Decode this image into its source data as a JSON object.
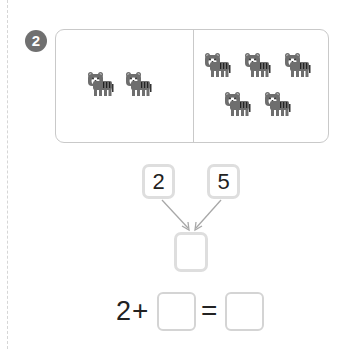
{
  "problem": {
    "number": "2",
    "left_group_count": 2,
    "right_group_count": 5,
    "icon": "tiger-icon"
  },
  "number_bond": {
    "left_part": "2",
    "right_part": "5",
    "whole": ""
  },
  "equation": {
    "first_term": "2",
    "plus_sign": "+",
    "second_term": "",
    "equals_sign": "=",
    "result": ""
  },
  "colors": {
    "badge": "#707070",
    "tiger_body": "#6e6e6e",
    "box_border": "#dedede",
    "card_border": "#c9c9c9",
    "arrow": "#a8a8a8"
  }
}
